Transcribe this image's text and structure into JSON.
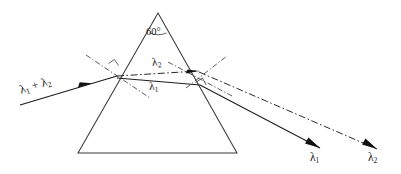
{
  "figure": {
    "kind": "prism-dispersion-diagram",
    "background_color": "#ffffff",
    "line_color": "#1c1c1c",
    "prism_stroke_color": "#3a3a3a"
  },
  "prism": {
    "apex_angle_label": "60°",
    "apex": {
      "x": 158,
      "y": 13
    },
    "base_left": {
      "x": 78,
      "y": 153
    },
    "base_right": {
      "x": 237,
      "y": 153
    }
  },
  "rays": {
    "incident": {
      "label_lambda": "λ",
      "label_sub_1": "1",
      "label_plus": " + ",
      "label_lambda2": "λ",
      "label_sub_2": "2",
      "style": "solid",
      "start": {
        "x": 20,
        "y": 105
      },
      "end": {
        "x": 117,
        "y": 76
      },
      "arrow_at": {
        "x": 88,
        "y": 84
      }
    },
    "internal_upper": {
      "label_lambda": "λ",
      "label_sub": "2",
      "style": "dash-dot",
      "start": {
        "x": 117,
        "y": 76
      },
      "end": {
        "x": 199,
        "y": 71
      }
    },
    "internal_lower": {
      "label_lambda": "λ",
      "label_sub": "1",
      "style": "solid",
      "start": {
        "x": 117,
        "y": 78
      },
      "end": {
        "x": 200,
        "y": 85
      }
    },
    "exit_lambda1": {
      "label_lambda": "λ",
      "label_sub": "1",
      "style": "solid",
      "start": {
        "x": 200,
        "y": 85
      },
      "end": {
        "x": 320,
        "y": 148
      }
    },
    "exit_lambda2": {
      "label_lambda": "λ",
      "label_sub": "2",
      "style": "dash-dot",
      "start": {
        "x": 199,
        "y": 72
      },
      "end": {
        "x": 377,
        "y": 149
      }
    }
  },
  "normals": {
    "entry_normal": {
      "name": "entry-surface-normal",
      "style": "dash-dot",
      "start": {
        "x": 86,
        "y": 55
      },
      "end": {
        "x": 150,
        "y": 98
      }
    },
    "exit_normal": {
      "name": "exit-surface-normal",
      "style": "dash-dot",
      "start": {
        "x": 168,
        "y": 62
      },
      "end": {
        "x": 232,
        "y": 96
      }
    },
    "exit_normal_upper": {
      "name": "exit-normal-upper-extension",
      "style": "dash-dot",
      "start": {
        "x": 186,
        "y": 88
      },
      "end": {
        "x": 227,
        "y": 56
      }
    }
  }
}
